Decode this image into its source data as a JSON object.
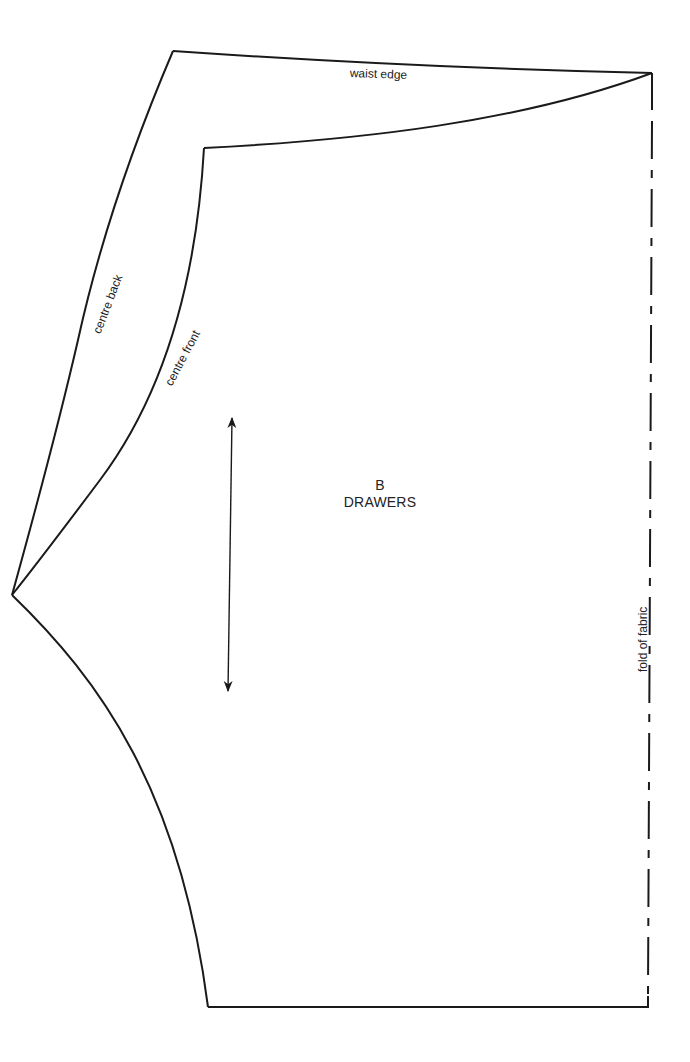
{
  "pattern": {
    "piece_letter": "B",
    "piece_name": "DRAWERS",
    "labels": {
      "waist_edge": "waist edge",
      "centre_back": "centre back",
      "centre_front": "centre front",
      "fold": "fold of fabric"
    },
    "markings": {
      "grainline": "double-headed-arrow",
      "fold_line_style": "dash-dot"
    },
    "colors": {
      "line": "#1a1a1a",
      "background": "#ffffff"
    }
  }
}
